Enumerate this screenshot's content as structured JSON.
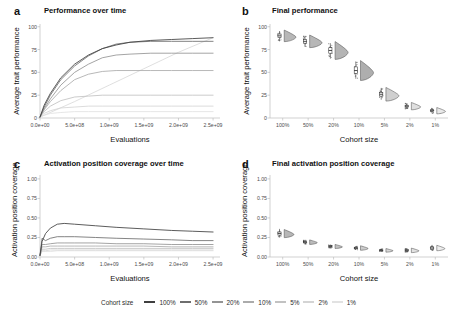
{
  "figure": {
    "background": "#ffffff",
    "panels": [
      {
        "letter": "a",
        "title": "Performance over time",
        "xlabel": "Evaluations",
        "ylabel": "Average trait performance"
      },
      {
        "letter": "b",
        "title": "Final performance",
        "xlabel": "Cohort size",
        "ylabel": "Average trait performance"
      },
      {
        "letter": "c",
        "title": "Activation position coverage over time",
        "xlabel": "Evaluations",
        "ylabel": "Activation position coverage"
      },
      {
        "letter": "d",
        "title": "Final activation position coverage",
        "xlabel": "Cohort size",
        "ylabel": "Activation position coverage"
      }
    ]
  },
  "legend": {
    "title": "Cohort size",
    "items": [
      {
        "label": "100%",
        "color": "#3f3f3f"
      },
      {
        "label": "50%",
        "color": "#6e6e6e"
      },
      {
        "label": "20%",
        "color": "#949494"
      },
      {
        "label": "10%",
        "color": "#ababab"
      },
      {
        "label": "5%",
        "color": "#c2c2c2"
      },
      {
        "label": "2%",
        "color": "#d4d4d4"
      },
      {
        "label": "1%",
        "color": "#e2e2e2"
      }
    ]
  },
  "chart_data": [
    {
      "id": "panel-a",
      "type": "line",
      "title": "Performance over time",
      "xlabel": "Evaluations",
      "ylabel": "Average trait performance",
      "xlim": [
        0,
        2600000000
      ],
      "ylim": [
        0,
        103
      ],
      "grid": false,
      "xticks": [
        0,
        500000000,
        1000000000,
        1500000000,
        2000000000,
        2500000000
      ],
      "xticklabels": [
        "0.0e+00",
        "5.0e+08",
        "1.0e+09",
        "1.5e+09",
        "2.0e+09",
        "2.5e+09"
      ],
      "yticks": [
        0,
        25,
        50,
        75,
        100
      ],
      "yticklabels": [
        "0",
        "25",
        "50",
        "75",
        "100"
      ],
      "legend_position": "bottom",
      "series": [
        {
          "name": "100%",
          "color": "#3f3f3f",
          "x": [
            0,
            60000000,
            150000000,
            300000000,
            500000000,
            700000000,
            900000000,
            1100000000,
            1300000000,
            1600000000,
            1900000000,
            2200000000,
            2500000000
          ],
          "values": [
            1,
            14,
            27,
            44,
            59,
            69,
            76,
            80,
            83,
            85,
            86,
            87,
            88
          ]
        },
        {
          "name": "50%",
          "color": "#6e6e6e",
          "x": [
            0,
            60000000,
            150000000,
            300000000,
            500000000,
            700000000,
            900000000,
            1100000000,
            1300000000,
            1600000000,
            1900000000,
            2200000000,
            2500000000
          ],
          "values": [
            1,
            12,
            25,
            42,
            57,
            68,
            76,
            81,
            83,
            84,
            84,
            84,
            84
          ]
        },
        {
          "name": "20%",
          "color": "#949494",
          "x": [
            0,
            60000000,
            150000000,
            300000000,
            500000000,
            700000000,
            900000000,
            1100000000,
            1300000000,
            1600000000,
            1900000000,
            2200000000,
            2500000000
          ],
          "values": [
            1,
            10,
            21,
            36,
            50,
            59,
            66,
            69,
            70,
            71,
            71,
            71,
            71
          ]
        },
        {
          "name": "10%",
          "color": "#ababab",
          "x": [
            0,
            60000000,
            150000000,
            300000000,
            500000000,
            700000000,
            900000000,
            1100000000,
            1300000000,
            1600000000,
            1900000000,
            2200000000,
            2500000000
          ],
          "values": [
            1,
            9,
            18,
            30,
            42,
            48,
            51,
            52,
            52,
            52,
            52,
            52,
            52
          ]
        },
        {
          "name": "5%",
          "color": "#c2c2c2",
          "x": [
            0,
            60000000,
            150000000,
            300000000,
            500000000,
            700000000,
            900000000,
            1100000000,
            1300000000,
            1600000000,
            1900000000,
            2200000000,
            2500000000
          ],
          "values": [
            1,
            7,
            13,
            19,
            23,
            24,
            25,
            25,
            25,
            25,
            25,
            25,
            25
          ]
        },
        {
          "name": "2%",
          "color": "#d4d4d4",
          "x": [
            0,
            60000000,
            150000000,
            300000000,
            500000000,
            700000000,
            900000000,
            1100000000,
            1300000000,
            1600000000,
            1900000000,
            2200000000,
            2500000000
          ],
          "values": [
            1,
            5,
            8,
            11,
            12,
            13,
            13,
            13,
            13,
            13,
            13,
            13,
            13
          ]
        },
        {
          "name": "1%",
          "color": "#e2e2e2",
          "x": [
            0,
            60000000,
            150000000,
            300000000,
            500000000,
            700000000,
            900000000,
            1100000000,
            1300000000,
            1600000000,
            1900000000,
            2200000000,
            2500000000
          ],
          "values": [
            1,
            3,
            5,
            6,
            7,
            7,
            7,
            7,
            7,
            7,
            7,
            7,
            7
          ]
        },
        {
          "name": "1%-linear",
          "color": "#d9d9d9",
          "x": [
            0,
            500000000,
            1000000000,
            1500000000,
            2000000000,
            2500000000
          ],
          "values": [
            1,
            18,
            36,
            54,
            72,
            88
          ]
        }
      ]
    },
    {
      "id": "panel-b",
      "type": "violin",
      "title": "Final performance",
      "xlabel": "Cohort size",
      "ylabel": "Average trait performance",
      "ylim": [
        0,
        103
      ],
      "grid": false,
      "yticks": [
        0,
        25,
        50,
        75,
        100
      ],
      "yticklabels": [
        "0",
        "25",
        "50",
        "75",
        "100"
      ],
      "categories": [
        "100%",
        "50%",
        "20%",
        "10%",
        "5%",
        "2%",
        "1%"
      ],
      "groups": [
        {
          "category": "100%",
          "median": 90,
          "q1": 88,
          "q3": 92,
          "low": 84,
          "high": 95,
          "spread": 11,
          "fill": "#b3b3b3"
        },
        {
          "category": "50%",
          "median": 84,
          "q1": 82,
          "q3": 86,
          "low": 78,
          "high": 90,
          "spread": 12,
          "fill": "#b3b3b3"
        },
        {
          "category": "20%",
          "median": 74,
          "q1": 71,
          "q3": 77,
          "low": 65,
          "high": 82,
          "spread": 17,
          "fill": "#b0b0b0"
        },
        {
          "category": "10%",
          "median": 52,
          "q1": 49,
          "q3": 56,
          "low": 43,
          "high": 62,
          "spread": 19,
          "fill": "#aaaaaa"
        },
        {
          "category": "5%",
          "median": 26,
          "q1": 24,
          "q3": 28,
          "low": 20,
          "high": 33,
          "spread": 13,
          "fill": "#cccccc"
        },
        {
          "category": "2%",
          "median": 13,
          "q1": 12,
          "q3": 14,
          "low": 10,
          "high": 16,
          "spread": 7,
          "fill": "#dddddd"
        },
        {
          "category": "1%",
          "median": 8,
          "q1": 7,
          "q3": 9,
          "low": 6,
          "high": 11,
          "spread": 6,
          "fill": "#e8e8e8"
        }
      ]
    },
    {
      "id": "panel-c",
      "type": "line",
      "title": "Activation position coverage over time",
      "xlabel": "Evaluations",
      "ylabel": "Activation position coverage",
      "xlim": [
        0,
        2600000000
      ],
      "ylim": [
        0,
        1.05
      ],
      "grid": false,
      "xticks": [
        0,
        500000000,
        1000000000,
        1500000000,
        2000000000,
        2500000000
      ],
      "xticklabels": [
        "0.0e+00",
        "5.0e+08",
        "1.0e+09",
        "1.5e+09",
        "2.0e+09",
        "2.5e+09"
      ],
      "yticks": [
        0,
        0.25,
        0.5,
        0.75,
        1.0
      ],
      "yticklabels": [
        "0.00",
        "0.25",
        "0.50",
        "0.75",
        "1.00"
      ],
      "series": [
        {
          "name": "100%",
          "color": "#3f3f3f",
          "x": [
            0,
            30000000,
            80000000,
            150000000,
            250000000,
            350000000,
            500000000,
            800000000,
            1100000000,
            1500000000,
            1900000000,
            2200000000,
            2500000000
          ],
          "values": [
            0.02,
            0.2,
            0.3,
            0.37,
            0.42,
            0.43,
            0.42,
            0.4,
            0.38,
            0.36,
            0.34,
            0.33,
            0.32
          ]
        },
        {
          "name": "50%",
          "color": "#6e6e6e",
          "x": [
            0,
            30000000,
            80000000,
            150000000,
            250000000,
            350000000,
            500000000,
            800000000,
            1100000000,
            1500000000,
            1900000000,
            2200000000,
            2500000000
          ],
          "values": [
            0.02,
            0.24,
            0.21,
            0.24,
            0.26,
            0.26,
            0.26,
            0.25,
            0.24,
            0.23,
            0.22,
            0.21,
            0.21
          ]
        },
        {
          "name": "20%",
          "color": "#949494",
          "x": [
            0,
            30000000,
            80000000,
            150000000,
            250000000,
            350000000,
            500000000,
            800000000,
            1100000000,
            1500000000,
            1900000000,
            2200000000,
            2500000000
          ],
          "values": [
            0.02,
            0.16,
            0.16,
            0.17,
            0.18,
            0.18,
            0.18,
            0.18,
            0.17,
            0.17,
            0.16,
            0.16,
            0.16
          ]
        },
        {
          "name": "10%",
          "color": "#ababab",
          "x": [
            0,
            30000000,
            80000000,
            150000000,
            250000000,
            350000000,
            500000000,
            800000000,
            1100000000,
            1500000000,
            1900000000,
            2200000000,
            2500000000
          ],
          "values": [
            0.02,
            0.13,
            0.13,
            0.14,
            0.14,
            0.14,
            0.14,
            0.14,
            0.14,
            0.14,
            0.13,
            0.13,
            0.13
          ]
        },
        {
          "name": "5%",
          "color": "#c2c2c2",
          "x": [
            0,
            30000000,
            80000000,
            150000000,
            250000000,
            350000000,
            500000000,
            800000000,
            1100000000,
            1500000000,
            1900000000,
            2200000000,
            2500000000
          ],
          "values": [
            0.02,
            0.1,
            0.1,
            0.11,
            0.11,
            0.11,
            0.11,
            0.11,
            0.11,
            0.11,
            0.11,
            0.11,
            0.11
          ]
        },
        {
          "name": "2%",
          "color": "#d4d4d4",
          "x": [
            0,
            30000000,
            80000000,
            150000000,
            250000000,
            350000000,
            500000000,
            800000000,
            1100000000,
            1500000000,
            1900000000,
            2200000000,
            2500000000
          ],
          "values": [
            0.02,
            0.08,
            0.08,
            0.09,
            0.09,
            0.09,
            0.09,
            0.09,
            0.09,
            0.09,
            0.09,
            0.09,
            0.09
          ]
        },
        {
          "name": "1%",
          "color": "#e2e2e2",
          "x": [
            0,
            30000000,
            80000000,
            150000000,
            250000000,
            350000000,
            500000000,
            800000000,
            1100000000,
            1500000000,
            1900000000,
            2200000000,
            2500000000
          ],
          "values": [
            0.02,
            0.07,
            0.07,
            0.07,
            0.08,
            0.08,
            0.08,
            0.08,
            0.08,
            0.08,
            0.08,
            0.08,
            0.08
          ]
        }
      ]
    },
    {
      "id": "panel-d",
      "type": "violin",
      "title": "Final activation position coverage",
      "xlabel": "Cohort size",
      "ylabel": "Activation position coverage",
      "ylim": [
        0,
        1.05
      ],
      "grid": false,
      "yticks": [
        0,
        0.25,
        0.5,
        0.75,
        1.0
      ],
      "yticklabels": [
        "0.00",
        "0.25",
        "0.50",
        "0.75",
        "1.00"
      ],
      "categories": [
        "100%",
        "50%",
        "20%",
        "10%",
        "5%",
        "2%",
        "1%"
      ],
      "groups": [
        {
          "category": "100%",
          "median": 0.3,
          "q1": 0.28,
          "q3": 0.32,
          "low": 0.25,
          "high": 0.36,
          "spread": 0.09,
          "fill": "#b3b3b3"
        },
        {
          "category": "50%",
          "median": 0.19,
          "q1": 0.18,
          "q3": 0.2,
          "low": 0.16,
          "high": 0.22,
          "spread": 0.05,
          "fill": "#b8b8b8"
        },
        {
          "category": "20%",
          "median": 0.135,
          "q1": 0.125,
          "q3": 0.145,
          "low": 0.11,
          "high": 0.16,
          "spread": 0.045,
          "fill": "#bfbfbf"
        },
        {
          "category": "10%",
          "median": 0.115,
          "q1": 0.105,
          "q3": 0.125,
          "low": 0.09,
          "high": 0.14,
          "spread": 0.05,
          "fill": "#c9c9c9"
        },
        {
          "category": "5%",
          "median": 0.085,
          "q1": 0.078,
          "q3": 0.092,
          "low": 0.065,
          "high": 0.105,
          "spread": 0.04,
          "fill": "#d6d6d6"
        },
        {
          "category": "2%",
          "median": 0.085,
          "q1": 0.075,
          "q3": 0.095,
          "low": 0.06,
          "high": 0.115,
          "spread": 0.05,
          "fill": "#e0e0e0"
        },
        {
          "category": "1%",
          "median": 0.115,
          "q1": 0.1,
          "q3": 0.13,
          "low": 0.08,
          "high": 0.155,
          "spread": 0.06,
          "fill": "#ededed"
        }
      ]
    }
  ]
}
